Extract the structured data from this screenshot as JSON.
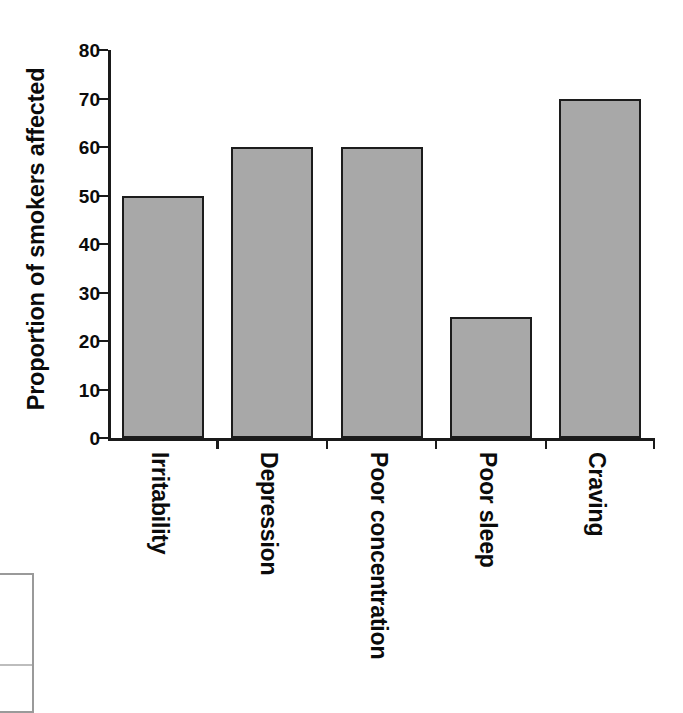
{
  "chart_data": {
    "type": "bar",
    "title": "",
    "xlabel": "",
    "ylabel": "Proportion of smokers affected",
    "categories": [
      "Irritability",
      "Depression",
      "Poor concentration",
      "Poor sleep",
      "Craving"
    ],
    "values": [
      50,
      60,
      60,
      25,
      70
    ],
    "ylim": [
      0,
      80
    ],
    "ytick_values": [
      0,
      10,
      20,
      30,
      40,
      50,
      60,
      70,
      80
    ],
    "ytick_labels": [
      "0",
      "10",
      "20",
      "30",
      "40",
      "50",
      "60",
      "70",
      "80"
    ],
    "grid": false,
    "legend": false,
    "legend_position": "none",
    "series": [
      {
        "name": "Proportion of smokers affected",
        "values": [
          50,
          60,
          60,
          25,
          70
        ]
      }
    ],
    "colors": {
      "bar_fill": "#a8a8a8",
      "bar_edge": "#1c1c1c",
      "axis": "#1a1a1a",
      "text": "#0b0b0b",
      "background": "#ffffff"
    }
  },
  "artifact": {
    "table_fragment_border_color": "#9a9a9a"
  }
}
